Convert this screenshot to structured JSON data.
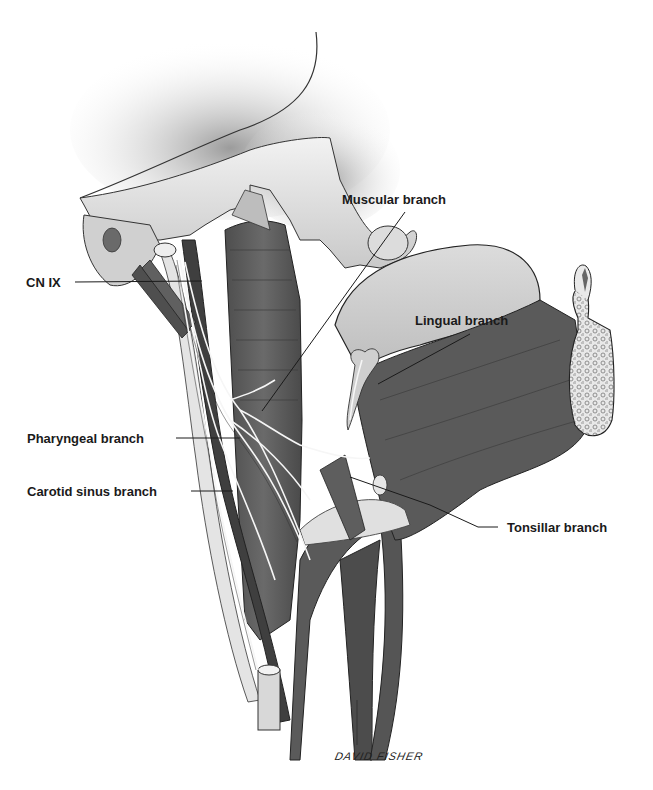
{
  "figure": {
    "labels": [
      {
        "id": "cn-ix",
        "text": "CN IX"
      },
      {
        "id": "muscular-branch",
        "text": "Muscular branch"
      },
      {
        "id": "lingual-branch",
        "text": "Lingual branch"
      },
      {
        "id": "pharyngeal-branch",
        "text": "Pharyngeal branch"
      },
      {
        "id": "carotid-sinus-branch",
        "text": "Carotid sinus branch"
      },
      {
        "id": "tonsillar-branch",
        "text": "Tonsillar branch"
      }
    ],
    "signature": "DAVID FISHER",
    "colors": {
      "background": "#ffffff",
      "bone": "#e6e6e6",
      "bone_shadow": "#a8a8a8",
      "muscle": "#5e5e5e",
      "muscle_dark": "#444444",
      "vessel": "#4a4a4a",
      "nerve": "#f4f4f4",
      "outline": "#222222",
      "label_text": "#1a1a1a"
    }
  }
}
